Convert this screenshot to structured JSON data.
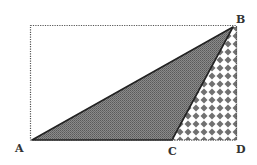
{
  "diagram": {
    "type": "geometry",
    "points": {
      "A": {
        "label": "A",
        "x": 32,
        "y": 140
      },
      "B": {
        "label": "B",
        "x": 233,
        "y": 27
      },
      "C": {
        "label": "C",
        "x": 172,
        "y": 140
      },
      "D": {
        "label": "D",
        "x": 237,
        "y": 140
      }
    },
    "labels": {
      "A": "A",
      "B": "B",
      "C": "C",
      "D": "D"
    },
    "shapes": [
      {
        "name": "bounding-rectangle",
        "style": "dotted"
      },
      {
        "name": "triangle-ABC",
        "fill": "dark-gray-stipple"
      },
      {
        "name": "triangle-BCD",
        "fill": "checkered-diamond"
      }
    ],
    "colors": {
      "triangle_fill": "#7a7a7a",
      "checker_fill": "#6e6e6e",
      "line": "#222222",
      "dotted": "#555555"
    }
  }
}
